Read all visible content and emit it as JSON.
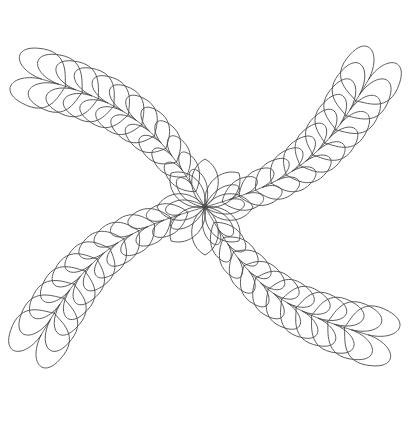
{
  "document": {
    "title": "Feathered X Quilting Motif",
    "kind": "line-art-drawing",
    "width": 410,
    "height": 422,
    "background_color": "#ffffff",
    "stroke_color": "#4a4a4a",
    "stroke_width": 0.9
  },
  "motif": {
    "name": "feathered-x",
    "symmetry": "four-fold-mirror",
    "center": {
      "x": 205,
      "y": 207
    },
    "bounds": {
      "left": 10,
      "top": 20,
      "right": 395,
      "bottom": 400
    },
    "arm_count": 4,
    "arms": [
      {
        "name": "upper-left",
        "angle_deg": 218,
        "tip": {
          "x": 52,
          "y": 62
        }
      },
      {
        "name": "upper-right",
        "angle_deg": 322,
        "tip": {
          "x": 358,
          "y": 62
        }
      },
      {
        "name": "lower-left",
        "angle_deg": 142,
        "tip": {
          "x": 52,
          "y": 352
        }
      },
      {
        "name": "lower-right",
        "angle_deg": 38,
        "tip": {
          "x": 358,
          "y": 352
        }
      }
    ],
    "lobes_per_side": 12,
    "lobe_size_min": 9,
    "lobe_size_max": 31,
    "center_rosette": {
      "petal_count": 8,
      "petal_length": 48,
      "petal_width": 19
    }
  }
}
